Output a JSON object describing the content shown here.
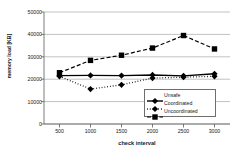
{
  "chart_data": {
    "type": "line",
    "title": "",
    "xlabel": "check interval",
    "ylabel": "memory load [KB]",
    "x": [
      500,
      1000,
      1500,
      2000,
      2500,
      3000
    ],
    "xtick_labels": [
      "500",
      "1000",
      "1500",
      "2000",
      "2500",
      "3000"
    ],
    "ytick_labels": [
      "0",
      "10000",
      "20000",
      "30000",
      "40000",
      "50000"
    ],
    "yticks": [
      0,
      10000,
      20000,
      30000,
      40000,
      50000
    ],
    "xlim": [
      250,
      3250
    ],
    "ylim": [
      0,
      50000
    ],
    "grid": "horizontal",
    "legend_position": "lower-right",
    "series": [
      {
        "name": "Unsafe",
        "marker": "diamond",
        "line_style": "solid",
        "color": "#000000",
        "values": [
          21600,
          21700,
          21600,
          21900,
          21500,
          22400
        ]
      },
      {
        "name": "Coordinated",
        "marker": "diamond",
        "line_style": "dotted",
        "color": "#000000",
        "values": [
          21300,
          15600,
          17500,
          20500,
          20900,
          21300
        ]
      },
      {
        "name": "Uncoordinated",
        "marker": "square",
        "line_style": "dashed",
        "color": "#000000",
        "values": [
          22900,
          28400,
          30700,
          33900,
          39500,
          33500
        ]
      }
    ]
  }
}
